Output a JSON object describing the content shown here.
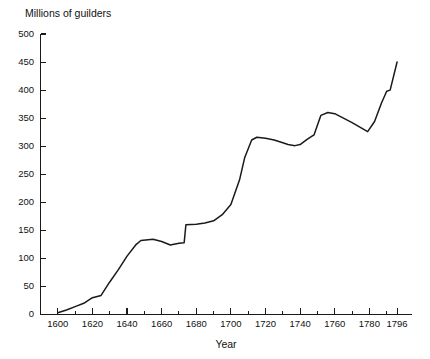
{
  "chart_data": {
    "type": "line",
    "title": "",
    "ylabel": "Millions of guilders",
    "xlabel": "Year",
    "ylim": [
      0,
      500
    ],
    "xlim": [
      1590,
      1800
    ],
    "grid": false,
    "legend": "none",
    "y_ticks": [
      0,
      50,
      100,
      150,
      200,
      250,
      300,
      350,
      400,
      450,
      500
    ],
    "y_tick_labels": [
      "0",
      "50",
      "100",
      "150",
      "200",
      "250",
      "300",
      "350",
      "400",
      "450",
      "500"
    ],
    "x_ticks": [
      1600,
      1610,
      1620,
      1630,
      1640,
      1650,
      1660,
      1670,
      1680,
      1690,
      1700,
      1710,
      1720,
      1730,
      1740,
      1750,
      1760,
      1770,
      1780,
      1790,
      1796
    ],
    "x_tick_labels_major": [
      "1600",
      "1620",
      "1640",
      "1660",
      "1680",
      "1700",
      "1720",
      "1740",
      "1760",
      "1780",
      "1796"
    ],
    "x_major_ticks": [
      1600,
      1620,
      1640,
      1660,
      1680,
      1700,
      1720,
      1740,
      1760,
      1780,
      1796
    ],
    "series": [
      {
        "name": "Millions of guilders",
        "x": [
          1600,
          1605,
          1610,
          1615,
          1620,
          1625,
          1630,
          1635,
          1640,
          1645,
          1648,
          1655,
          1660,
          1665,
          1670,
          1673,
          1674,
          1680,
          1685,
          1690,
          1695,
          1700,
          1705,
          1708,
          1712,
          1715,
          1720,
          1725,
          1730,
          1733,
          1737,
          1740,
          1744,
          1748,
          1752,
          1756,
          1760,
          1765,
          1770,
          1775,
          1779,
          1783,
          1787,
          1790,
          1792,
          1796
        ],
        "y": [
          3,
          8,
          14,
          20,
          30,
          34,
          58,
          80,
          104,
          124,
          132,
          134,
          130,
          124,
          127,
          128,
          160,
          161,
          163,
          167,
          178,
          196,
          240,
          280,
          311,
          316,
          314,
          311,
          306,
          303,
          301,
          303,
          312,
          320,
          355,
          360,
          358,
          350,
          342,
          333,
          326,
          344,
          377,
          398,
          400,
          450
        ]
      }
    ]
  }
}
